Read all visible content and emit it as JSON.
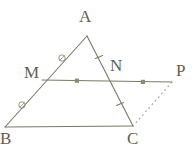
{
  "figure": {
    "type": "geometry-diagram",
    "background_color": "#ffffff",
    "stroke_color": "#7a7a63",
    "label_color": "#5f5f4e",
    "width": 196,
    "height": 157,
    "points": [
      {
        "name": "A",
        "label": "A",
        "x": 87,
        "y": 36,
        "label_x": 79,
        "label_y": 8
      },
      {
        "name": "M",
        "label": "M",
        "x": 42,
        "y": 80,
        "label_x": 24,
        "label_y": 64
      },
      {
        "name": "N",
        "label": "N",
        "x": 110,
        "y": 74,
        "label_x": 110,
        "label_y": 57
      },
      {
        "name": "P",
        "label": "P",
        "x": 172,
        "y": 82,
        "label_x": 176,
        "label_y": 62
      },
      {
        "name": "B",
        "label": "B",
        "x": 5,
        "y": 127,
        "label_x": 0,
        "label_y": 130
      },
      {
        "name": "C",
        "label": "C",
        "x": 133,
        "y": 126,
        "label_x": 127,
        "label_y": 130
      }
    ],
    "segments": [
      {
        "name": "segment-AB",
        "from": "A",
        "to": "B",
        "style": "solid",
        "x1": 87,
        "y1": 36,
        "x2": 5,
        "y2": 127
      },
      {
        "name": "segment-AC",
        "from": "A",
        "to": "C",
        "style": "solid",
        "x1": 87,
        "y1": 36,
        "x2": 133,
        "y2": 126
      },
      {
        "name": "segment-BC",
        "from": "B",
        "to": "C",
        "style": "solid",
        "x1": 5,
        "y1": 127,
        "x2": 133,
        "y2": 126
      },
      {
        "name": "segment-MP",
        "from": "M",
        "to": "P",
        "style": "solid",
        "x1": 42,
        "y1": 80,
        "x2": 172,
        "y2": 82
      },
      {
        "name": "segment-CP",
        "from": "C",
        "to": "P",
        "style": "dotted",
        "x1": 133,
        "y1": 126,
        "x2": 172,
        "y2": 82
      }
    ],
    "tick_marks": [
      {
        "name": "tick-AM",
        "shape": "circle",
        "on": "segment-AB",
        "x": 62,
        "y": 58
      },
      {
        "name": "tick-MB",
        "shape": "circle",
        "on": "segment-AB",
        "x": 22,
        "y": 105
      },
      {
        "name": "tick-AN",
        "shape": "slash",
        "on": "segment-AC",
        "x": 99,
        "y": 57,
        "angle": -28
      },
      {
        "name": "tick-NC",
        "shape": "slash",
        "on": "segment-AC",
        "x": 120,
        "y": 104,
        "angle": -28
      },
      {
        "name": "tick-MN",
        "shape": "square",
        "on": "segment-MP",
        "x": 77,
        "y": 81
      },
      {
        "name": "tick-NP",
        "shape": "square",
        "on": "segment-MP",
        "x": 143,
        "y": 82
      }
    ]
  }
}
